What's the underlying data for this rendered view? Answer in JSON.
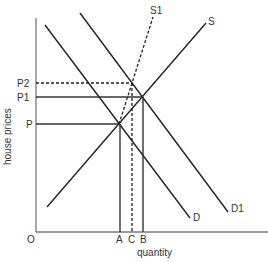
{
  "diagram": {
    "type": "supply-demand",
    "axes": {
      "x_label": "quantity",
      "y_label": "house prices",
      "origin_label": "O"
    },
    "price_levels": [
      {
        "label": "P2",
        "style": "dashed"
      },
      {
        "label": "P1",
        "style": "solid"
      },
      {
        "label": "P",
        "style": "solid"
      }
    ],
    "quantity_levels": [
      {
        "label": "A",
        "style": "solid"
      },
      {
        "label": "C",
        "style": "dashed"
      },
      {
        "label": "B",
        "style": "solid"
      }
    ],
    "curves": [
      {
        "label": "S",
        "kind": "supply",
        "style": "solid"
      },
      {
        "label": "S1",
        "kind": "supply",
        "style": "dashed"
      },
      {
        "label": "D",
        "kind": "demand",
        "style": "solid"
      },
      {
        "label": "D1",
        "kind": "demand",
        "style": "solid"
      }
    ],
    "colors": {
      "line": "#222222",
      "axis": "#777777",
      "text": "#333333"
    }
  }
}
